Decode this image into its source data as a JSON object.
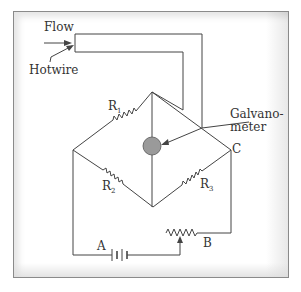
{
  "diagram": {
    "type": "Hot-wire anemometer Wheatstone bridge circuit",
    "labels": {
      "flow": "Flow",
      "hotwire": "Hotwire",
      "galvanometer_line1": "Galvano-",
      "galvanometer_line2": "meter",
      "r1": "R",
      "r1_sub": "1",
      "r2": "R",
      "r2_sub": "2",
      "r3": "R",
      "r3_sub": "3",
      "node_c": "C",
      "battery": "A",
      "rheostat": "B"
    },
    "colors": {
      "wire": "#444444",
      "galvanometer_fill": "#9a9a9a",
      "frame_border": "#8a8a8a",
      "text": "#333333"
    },
    "components": [
      {
        "id": "R1",
        "type": "resistor",
        "between": [
          "left-node",
          "top-node"
        ]
      },
      {
        "id": "R2",
        "type": "resistor",
        "between": [
          "left-node",
          "bottom-node"
        ]
      },
      {
        "id": "R3",
        "type": "resistor",
        "between": [
          "bottom-node",
          "C"
        ]
      },
      {
        "id": "G",
        "type": "galvanometer",
        "between": [
          "top-node",
          "bottom-node"
        ]
      },
      {
        "id": "Hotwire",
        "type": "sensing-element",
        "between": [
          "top-node",
          "C"
        ]
      },
      {
        "id": "A",
        "type": "battery"
      },
      {
        "id": "B",
        "type": "rheostat"
      }
    ]
  }
}
